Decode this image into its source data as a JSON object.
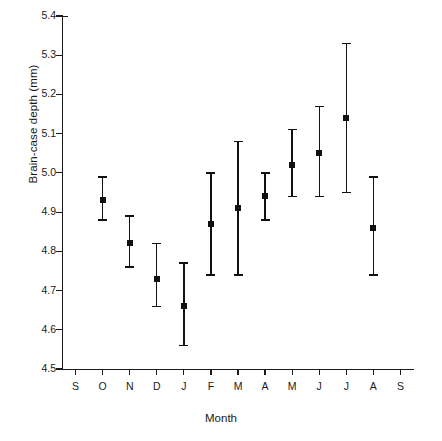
{
  "chart_data": {
    "type": "scatter",
    "title": "",
    "xlabel": "Month",
    "ylabel": "Brain-case depth (mm)",
    "ylim": [
      4.5,
      5.4
    ],
    "ytick_labels": [
      "5.4",
      "5.3",
      "5.2",
      "5.1",
      "5.0",
      "4.9",
      "4.8",
      "4.7",
      "4.6",
      "4.5"
    ],
    "ytick_values": [
      5.4,
      5.3,
      5.2,
      5.1,
      5.0,
      4.9,
      4.8,
      4.7,
      4.6,
      4.5
    ],
    "categories": [
      "S",
      "O",
      "N",
      "D",
      "J",
      "F",
      "M",
      "A",
      "M",
      "J",
      "J",
      "A",
      "S"
    ],
    "grid": false,
    "legend": "none",
    "error_bar_style": "capped-vertical",
    "series": [
      {
        "name": "Brain-case depth",
        "points": [
          {
            "category": "S",
            "index": 0,
            "value": null,
            "lower": null,
            "upper": null
          },
          {
            "category": "O",
            "index": 1,
            "value": 4.93,
            "lower": 4.88,
            "upper": 4.99
          },
          {
            "category": "N",
            "index": 2,
            "value": 4.82,
            "lower": 4.76,
            "upper": 4.89
          },
          {
            "category": "D",
            "index": 3,
            "value": 4.73,
            "lower": 4.66,
            "upper": 4.82
          },
          {
            "category": "J",
            "index": 4,
            "value": 4.66,
            "lower": 4.56,
            "upper": 4.77
          },
          {
            "category": "F",
            "index": 5,
            "value": 4.87,
            "lower": 4.74,
            "upper": 5.0
          },
          {
            "category": "M",
            "index": 6,
            "value": 4.91,
            "lower": 4.74,
            "upper": 5.08
          },
          {
            "category": "A",
            "index": 7,
            "value": 4.94,
            "lower": 4.88,
            "upper": 5.0
          },
          {
            "category": "M",
            "index": 8,
            "value": 5.02,
            "lower": 4.94,
            "upper": 5.11
          },
          {
            "category": "J",
            "index": 9,
            "value": 5.05,
            "lower": 4.94,
            "upper": 5.17
          },
          {
            "category": "J",
            "index": 10,
            "value": 5.14,
            "lower": 4.95,
            "upper": 5.33
          },
          {
            "category": "A",
            "index": 11,
            "value": 4.86,
            "lower": 4.74,
            "upper": 4.99
          },
          {
            "category": "S",
            "index": 12,
            "value": null,
            "lower": null,
            "upper": null
          }
        ]
      }
    ],
    "colors": {
      "marker": "#111111",
      "axis": "#1a1a1a",
      "background": "#ffffff"
    }
  }
}
